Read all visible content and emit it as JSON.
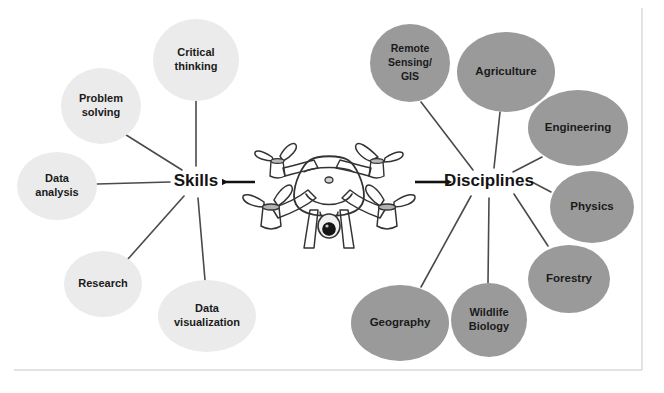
{
  "diagram": {
    "type": "concept-map",
    "background_color": "#ffffff",
    "frame_color": "#d8d8d8",
    "edge_color": "#4a4a4a",
    "arrow_color": "#111111",
    "center_image": "drone-illustration",
    "center_image_alt": "Quadcopter drone with four propellers and a gimbal camera"
  },
  "hubs": {
    "left": {
      "label": "Skills",
      "x": 196,
      "y": 182,
      "arrow_from_drone": true
    },
    "right": {
      "label": "Disciplines",
      "x": 489,
      "y": 182,
      "arrow_from_drone": true
    }
  },
  "skills": {
    "group_label": "Skills",
    "fill_color": "#ebebeb",
    "text_color": "#1a1a1a",
    "nodes": [
      {
        "label_lines": [
          "Critical",
          "thinking"
        ],
        "cx": 196,
        "cy": 60,
        "rx": 43,
        "ry": 41,
        "font_size": 11
      },
      {
        "label_lines": [
          "Problem",
          "solving"
        ],
        "cx": 101,
        "cy": 106,
        "rx": 40,
        "ry": 38,
        "font_size": 11
      },
      {
        "label_lines": [
          "Data",
          "analysis"
        ],
        "cx": 57,
        "cy": 186,
        "rx": 40,
        "ry": 34,
        "font_size": 11
      },
      {
        "label_lines": [
          "Research"
        ],
        "cx": 103,
        "cy": 284,
        "rx": 39,
        "ry": 33,
        "font_size": 11
      },
      {
        "label_lines": [
          "Data",
          "visualization"
        ],
        "cx": 207,
        "cy": 316,
        "rx": 49,
        "ry": 36,
        "font_size": 11
      }
    ]
  },
  "disciplines": {
    "group_label": "Disciplines",
    "fill_color": "#9a9a9a",
    "text_color": "#141414",
    "nodes": [
      {
        "label_lines": [
          "Remote",
          "Sensing/",
          "GIS"
        ],
        "cx": 410,
        "cy": 63,
        "rx": 40,
        "ry": 39,
        "font_size": 10.5
      },
      {
        "label_lines": [
          "Agriculture"
        ],
        "cx": 506,
        "cy": 72,
        "rx": 49,
        "ry": 40,
        "font_size": 11.5
      },
      {
        "label_lines": [
          "Engineering"
        ],
        "cx": 578,
        "cy": 128,
        "rx": 50,
        "ry": 38,
        "font_size": 11.5
      },
      {
        "label_lines": [
          "Physics"
        ],
        "cx": 592,
        "cy": 207,
        "rx": 42,
        "ry": 36,
        "font_size": 11.5
      },
      {
        "label_lines": [
          "Forestry"
        ],
        "cx": 569,
        "cy": 279,
        "rx": 41,
        "ry": 34,
        "font_size": 11.5
      },
      {
        "label_lines": [
          "Wildlife",
          "Biology"
        ],
        "cx": 489,
        "cy": 320,
        "rx": 38,
        "ry": 37,
        "font_size": 11
      },
      {
        "label_lines": [
          "Geography"
        ],
        "cx": 400,
        "cy": 323,
        "rx": 49,
        "ry": 38,
        "font_size": 11.5
      }
    ]
  },
  "edges": [
    {
      "from": "Skills",
      "to": "Critical thinking",
      "x1": 196,
      "y1": 166,
      "x2": 196,
      "y2": 101
    },
    {
      "from": "Skills",
      "to": "Problem solving",
      "x1": 182,
      "y1": 170,
      "x2": 123,
      "y2": 133
    },
    {
      "from": "Skills",
      "to": "Data analysis",
      "x1": 170,
      "y1": 182,
      "x2": 97,
      "y2": 184
    },
    {
      "from": "Skills",
      "to": "Research",
      "x1": 184,
      "y1": 196,
      "x2": 128,
      "y2": 259
    },
    {
      "from": "Skills",
      "to": "Data visualization",
      "x1": 198,
      "y1": 198,
      "x2": 205,
      "y2": 280
    },
    {
      "from": "Disciplines",
      "to": "Remote Sensing/GIS",
      "x1": 473,
      "y1": 170,
      "x2": 421,
      "y2": 102
    },
    {
      "from": "Disciplines",
      "to": "Agriculture",
      "x1": 494,
      "y1": 168,
      "x2": 500,
      "y2": 112
    },
    {
      "from": "Disciplines",
      "to": "Engineering",
      "x1": 513,
      "y1": 172,
      "x2": 542,
      "y2": 157
    },
    {
      "from": "Disciplines",
      "to": "Physics",
      "x1": 532,
      "y1": 182,
      "x2": 551,
      "y2": 192
    },
    {
      "from": "Disciplines",
      "to": "Forestry",
      "x1": 514,
      "y1": 194,
      "x2": 548,
      "y2": 246
    },
    {
      "from": "Disciplines",
      "to": "Wildlife Biology",
      "x1": 489,
      "y1": 198,
      "x2": 488,
      "y2": 283
    },
    {
      "from": "Disciplines",
      "to": "Geography",
      "x1": 471,
      "y1": 196,
      "x2": 421,
      "y2": 287
    }
  ],
  "arrows": [
    {
      "label": "drone-to-skills",
      "x1": 255,
      "y1": 182,
      "x2": 222,
      "y2": 182,
      "direction": "left"
    },
    {
      "label": "drone-to-disciplines",
      "x1": 415,
      "y1": 182,
      "x2": 447,
      "y2": 182,
      "direction": "right"
    }
  ],
  "frame": {
    "right_line_x": 642,
    "right_line_y1": 8,
    "right_line_y2": 370,
    "bottom_line_y": 370,
    "bottom_line_x1": 14,
    "bottom_line_x2": 642
  }
}
